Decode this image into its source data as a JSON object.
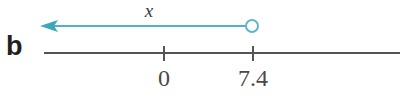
{
  "figure": {
    "part_label": "b",
    "variable_label": "x",
    "background_color": "#ffffff"
  },
  "number_line": {
    "color": "#555555",
    "start_x": 44,
    "end_x": 400,
    "y": 53,
    "thickness": 2,
    "ticks": [
      {
        "label": "0",
        "x": 164
      },
      {
        "label": "7.4",
        "x": 253
      }
    ]
  },
  "inequality_ray": {
    "color": "#4fb3c4",
    "y": 26,
    "arrow_tip_x": 40,
    "endpoint_x": 252,
    "endpoint_style": "open-circle",
    "endpoint_radius": 6,
    "direction": "left",
    "endpoint_value": "7.4",
    "meaning": "x < 7.4"
  }
}
